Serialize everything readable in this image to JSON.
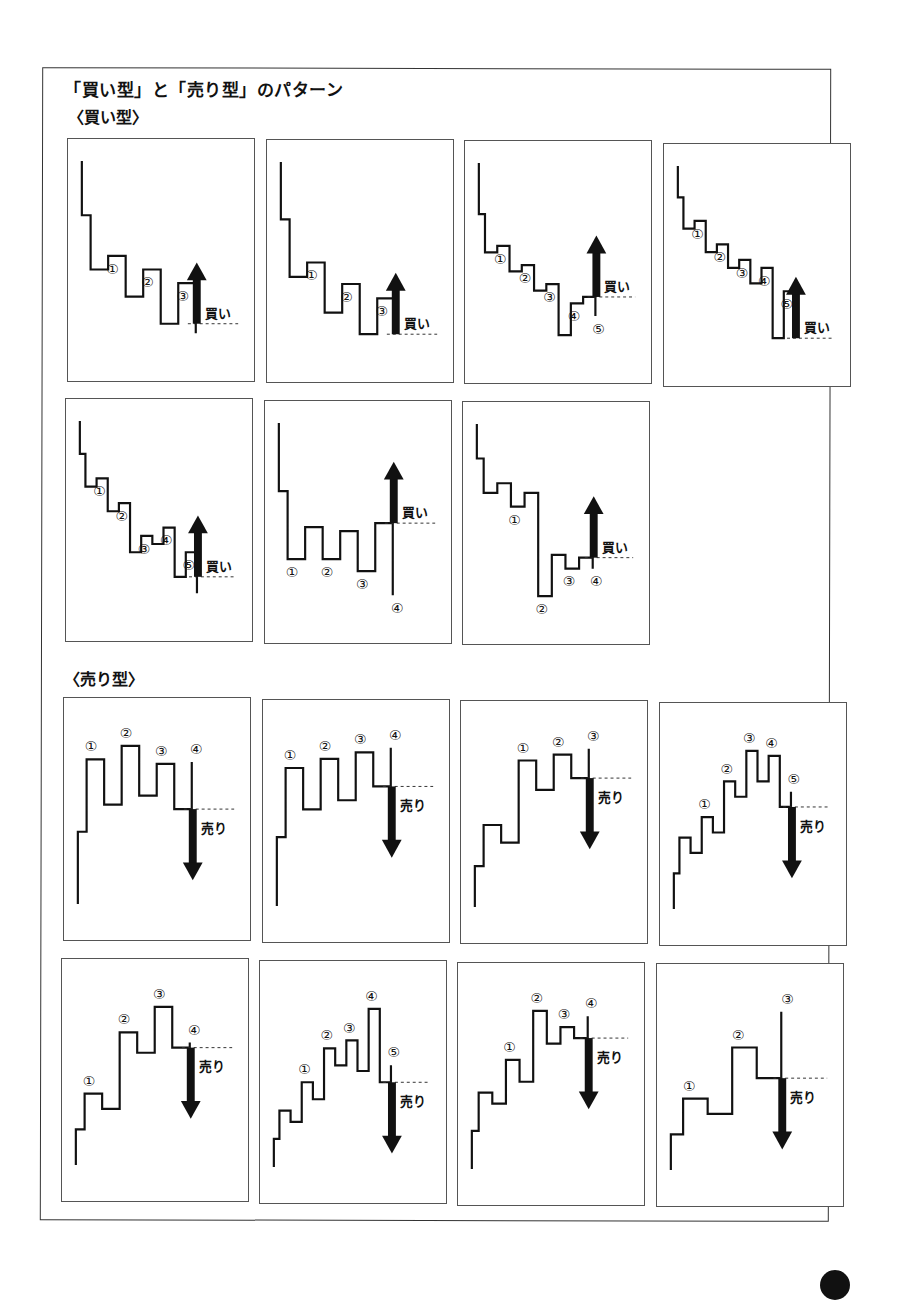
{
  "page": {
    "title": "「買い型」と「売り型」のパターン",
    "colors": {
      "line": "#111111",
      "frame": "#555555",
      "arrow": "#111111",
      "dotted": "#333333"
    }
  },
  "sections": [
    {
      "label": "〈買い型〉",
      "type": "buy",
      "panels": [
        {
          "levels": [
            0,
            40,
            30,
            60,
            40,
            80,
            50,
            87
          ],
          "start": -40,
          "labels": [
            [
              "①",
              2
            ],
            [
              "②",
              4
            ],
            [
              "③",
              6
            ]
          ],
          "breakout_index": 5,
          "signal": "買い",
          "signal_dir": "up"
        },
        {
          "levels": [
            0,
            40,
            30,
            65,
            45,
            80,
            55,
            75
          ],
          "start": -40,
          "labels": [
            [
              "①",
              2
            ],
            [
              "②",
              4
            ],
            [
              "③",
              6
            ]
          ],
          "breakout_index": 5,
          "signal": "買い",
          "signal_dir": "up"
        },
        {
          "levels": [
            0,
            30,
            25,
            45,
            40,
            60,
            55,
            95,
            70,
            65,
            80
          ],
          "start": -40,
          "labels": [
            [
              "①",
              2
            ],
            [
              "②",
              4
            ],
            [
              "③",
              6
            ],
            [
              "④",
              8
            ],
            [
              "⑤",
              10
            ]
          ],
          "breakout_index": 9,
          "signal": "買い",
          "signal_dir": "up"
        },
        {
          "levels": [
            0,
            20,
            15,
            35,
            30,
            45,
            40,
            55,
            45,
            90,
            60,
            80
          ],
          "start": -20,
          "labels": [
            [
              "①",
              2
            ],
            [
              "②",
              4
            ],
            [
              "③",
              6
            ],
            [
              "④",
              8
            ],
            [
              "⑤",
              10
            ]
          ],
          "breakout_index": 9,
          "signal": "買い",
          "signal_dir": "up"
        },
        {
          "levels": [
            0,
            20,
            15,
            35,
            30,
            60,
            50,
            55,
            45,
            75,
            60,
            85
          ],
          "start": -20,
          "labels": [
            [
              "①",
              2
            ],
            [
              "②",
              4
            ],
            [
              "③",
              6
            ],
            [
              "④",
              8
            ],
            [
              "⑤",
              10
            ]
          ],
          "breakout_index": 9,
          "signal": "買い",
          "signal_dir": "up"
        },
        {
          "levels": [
            0,
            85,
            45,
            85,
            50,
            100,
            40,
            130
          ],
          "start": -85,
          "labels": [
            [
              "①",
              1
            ],
            [
              "②",
              3
            ],
            [
              "③",
              5
            ],
            [
              "④",
              7
            ]
          ],
          "breakout_index": 6,
          "signal": "買い",
          "signal_dir": "up"
        },
        {
          "levels": [
            0,
            25,
            18,
            35,
            25,
            100,
            70,
            80,
            72,
            80
          ],
          "start": -25,
          "labels": [
            [
              "①",
              3
            ],
            [
              "②",
              5
            ],
            [
              "③",
              7
            ],
            [
              "④",
              9
            ]
          ],
          "breakout_index": 8,
          "signal": "買い",
          "signal_dir": "up"
        }
      ]
    },
    {
      "label": "〈売り型〉",
      "type": "sell",
      "panels": [
        {
          "levels": [
            0,
            80,
            30,
            95,
            40,
            75,
            25,
            77
          ],
          "start": -80,
          "labels": [
            [
              "①",
              1
            ],
            [
              "②",
              3
            ],
            [
              "③",
              5
            ],
            [
              "④",
              7
            ]
          ],
          "breakout_index": 6,
          "signal": "売り",
          "signal_dir": "down"
        },
        {
          "levels": [
            0,
            75,
            30,
            85,
            40,
            92,
            55,
            97
          ],
          "start": -75,
          "labels": [
            [
              "①",
              1
            ],
            [
              "②",
              3
            ],
            [
              "③",
              5
            ],
            [
              "④",
              7
            ]
          ],
          "breakout_index": 6,
          "signal": "売り",
          "signal_dir": "down"
        },
        {
          "levels": [
            0,
            35,
            20,
            90,
            65,
            95,
            75,
            100
          ],
          "start": -35,
          "labels": [
            [
              "①",
              3
            ],
            [
              "②",
              5
            ],
            [
              "③",
              7
            ]
          ],
          "breakout_index": 6,
          "signal": "売り",
          "signal_dir": "down"
        },
        {
          "levels": [
            0,
            35,
            20,
            55,
            40,
            90,
            75,
            120,
            90,
            115,
            65,
            80
          ],
          "start": -35,
          "labels": [
            [
              "①",
              3
            ],
            [
              "②",
              5
            ],
            [
              "③",
              7
            ],
            [
              "④",
              9
            ],
            [
              "⑤",
              11
            ]
          ],
          "breakout_index": 10,
          "signal": "売り",
          "signal_dir": "down"
        },
        {
          "levels": [
            0,
            35,
            20,
            95,
            75,
            120,
            80,
            85
          ],
          "start": -35,
          "labels": [
            [
              "①",
              1
            ],
            [
              "②",
              3
            ],
            [
              "③",
              5
            ],
            [
              "④",
              7
            ]
          ],
          "breakout_index": 6,
          "signal": "売り",
          "signal_dir": "down"
        },
        {
          "levels": [
            0,
            25,
            15,
            50,
            35,
            80,
            65,
            87,
            60,
            115,
            50,
            65
          ],
          "start": -25,
          "labels": [
            [
              "①",
              3
            ],
            [
              "②",
              5
            ],
            [
              "③",
              7
            ],
            [
              "④",
              9
            ],
            [
              "⑤",
              11
            ]
          ],
          "breakout_index": 10,
          "signal": "売り",
          "signal_dir": "down"
        },
        {
          "levels": [
            0,
            35,
            25,
            65,
            45,
            110,
            80,
            95,
            85,
            105
          ],
          "start": -35,
          "labels": [
            [
              "①",
              3
            ],
            [
              "②",
              5
            ],
            [
              "③",
              7
            ],
            [
              "④",
              9
            ]
          ],
          "breakout_index": 8,
          "signal": "売り",
          "signal_dir": "down"
        },
        {
          "levels": [
            0,
            35,
            20,
            85,
            55,
            120
          ],
          "start": -35,
          "labels": [
            [
              "①",
              1
            ],
            [
              "②",
              3
            ],
            [
              "③",
              5
            ]
          ],
          "breakout_index": 4,
          "signal": "売り",
          "signal_dir": "down"
        }
      ]
    }
  ]
}
